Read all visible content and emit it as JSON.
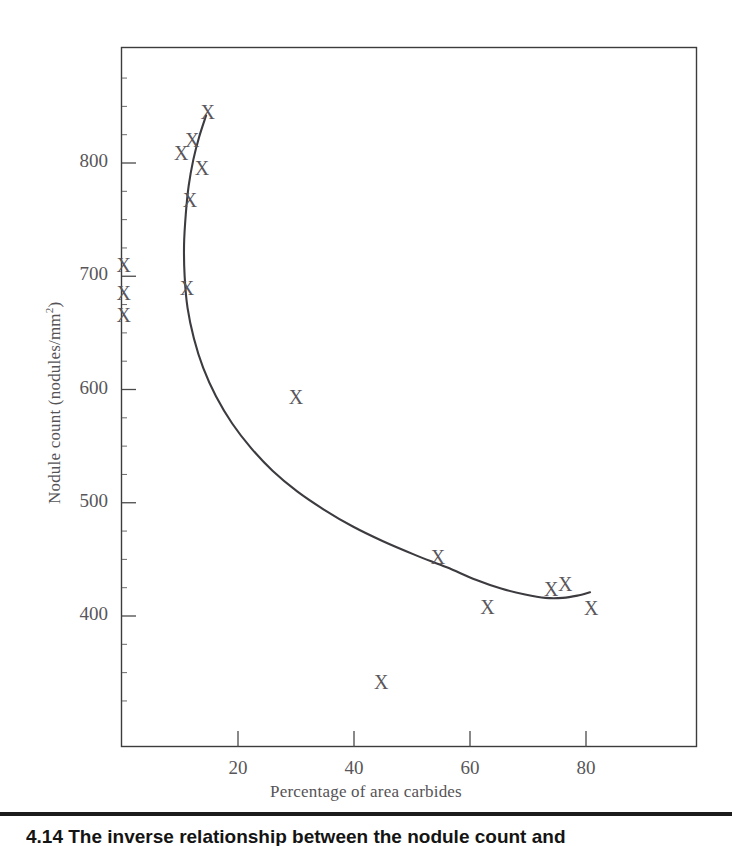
{
  "figure": {
    "caption": "4.14  The inverse relationship between the nodule count and",
    "background_color": "#ffffff",
    "frame_color": "#3c3c3c",
    "curve_color": "#3d3b40",
    "marker_color": "#5a575c",
    "text_color": "#58565a"
  },
  "chart_data": {
    "type": "scatter",
    "title": "",
    "subtitle": "",
    "xlabel": "Percentage of area carbides",
    "ylabel": "Nodule count (nodules/mm2)",
    "ylabel_display": "Nodule count (nodules/mm",
    "ylabel_superscript": "2",
    "ylabel_suffix": ")",
    "xlim": [
      0,
      99
    ],
    "ylim": [
      325,
      875
    ],
    "grid": false,
    "legend": "none",
    "xticks": [
      20,
      40,
      60,
      80
    ],
    "xtick_labels": [
      "20",
      "40",
      "60",
      "80"
    ],
    "yticks": [
      400,
      500,
      600,
      700,
      800
    ],
    "ytick_labels": [
      "400",
      "500",
      "600",
      "700",
      "800"
    ],
    "minor_ytick_step": 25,
    "marker_symbol": "X",
    "points": [
      {
        "x": 14.8,
        "y": 845
      },
      {
        "x": 12.1,
        "y": 820
      },
      {
        "x": 10.2,
        "y": 809
      },
      {
        "x": 13.8,
        "y": 796
      },
      {
        "x": 11.7,
        "y": 767
      },
      {
        "x": 0.3,
        "y": 710
      },
      {
        "x": 0.3,
        "y": 685
      },
      {
        "x": 0.3,
        "y": 666
      },
      {
        "x": 11.2,
        "y": 690
      },
      {
        "x": 30.0,
        "y": 593
      },
      {
        "x": 54.5,
        "y": 452
      },
      {
        "x": 63.0,
        "y": 408
      },
      {
        "x": 74.0,
        "y": 424
      },
      {
        "x": 76.4,
        "y": 428
      },
      {
        "x": 80.9,
        "y": 407
      },
      {
        "x": 44.7,
        "y": 342
      }
    ],
    "fit_curve": {
      "name": "fitted trend line",
      "points": [
        {
          "x": 14.5,
          "y": 842
        },
        {
          "x": 13.3,
          "y": 823
        },
        {
          "x": 12.3,
          "y": 803
        },
        {
          "x": 11.5,
          "y": 780
        },
        {
          "x": 11.0,
          "y": 755
        },
        {
          "x": 10.7,
          "y": 728
        },
        {
          "x": 10.8,
          "y": 700
        },
        {
          "x": 11.3,
          "y": 672
        },
        {
          "x": 12.4,
          "y": 645
        },
        {
          "x": 14.0,
          "y": 619
        },
        {
          "x": 16.2,
          "y": 594
        },
        {
          "x": 19.0,
          "y": 570
        },
        {
          "x": 22.3,
          "y": 548
        },
        {
          "x": 26.0,
          "y": 528
        },
        {
          "x": 30.2,
          "y": 510
        },
        {
          "x": 34.8,
          "y": 494
        },
        {
          "x": 39.8,
          "y": 479
        },
        {
          "x": 45.0,
          "y": 466
        },
        {
          "x": 50.5,
          "y": 454
        },
        {
          "x": 56.0,
          "y": 443
        },
        {
          "x": 61.0,
          "y": 432
        },
        {
          "x": 65.5,
          "y": 424
        },
        {
          "x": 69.5,
          "y": 419
        },
        {
          "x": 73.0,
          "y": 416
        },
        {
          "x": 76.0,
          "y": 416
        },
        {
          "x": 78.5,
          "y": 418
        },
        {
          "x": 80.7,
          "y": 421
        }
      ]
    }
  }
}
